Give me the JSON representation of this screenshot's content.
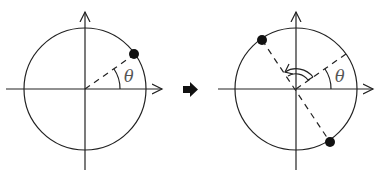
{
  "diagram": {
    "angle_label": "θ",
    "colors": {
      "stroke": "#222222",
      "dot": "#111111",
      "background": "#ffffff"
    },
    "panels": [
      {
        "id": "before",
        "center": [
          85,
          89
        ],
        "radius": 61,
        "points": [
          {
            "angle_deg": 35,
            "label": ""
          }
        ],
        "angle_mark_deg": 35,
        "rotation_arrow": false
      },
      {
        "id": "after",
        "center": [
          296,
          89
        ],
        "radius": 61,
        "points": [
          {
            "angle_deg": 125,
            "label": ""
          },
          {
            "angle_deg": -55,
            "label": ""
          }
        ],
        "angle_mark_deg": 35,
        "rotation_arrow": true
      }
    ],
    "transition_arrow": "➡"
  }
}
